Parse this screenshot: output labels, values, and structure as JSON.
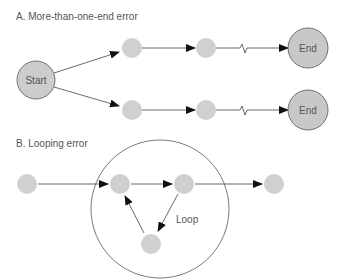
{
  "section_a": {
    "title": "A.  More-than-one-end error",
    "start_label": "Start",
    "end_label_top": "End",
    "end_label_bottom": "End"
  },
  "section_b": {
    "title": "B.  Looping error",
    "loop_label": "Loop"
  },
  "colors": {
    "node_fill": "#cfcfcf",
    "terminal_fill": "#c8c8c8",
    "stroke": "#555555",
    "arrow": "#111111"
  }
}
